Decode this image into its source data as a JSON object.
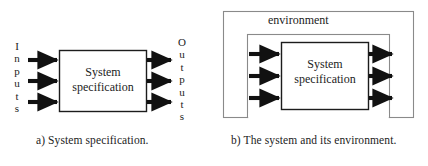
{
  "figure": {
    "type": "block-diagram",
    "panels": [
      {
        "id": "a",
        "caption": "a) System specification.",
        "input_label": "Inputs",
        "input_label_letters": [
          "I",
          "n",
          "p",
          "u",
          "t",
          "s"
        ],
        "output_label": "Outputs",
        "output_label_letters": [
          "O",
          "u",
          "t",
          "p",
          "u",
          "t",
          "s"
        ],
        "box_title_line1": "System",
        "box_title_line2": "specification",
        "input_arrow_count": 3,
        "output_arrow_count": 3
      },
      {
        "id": "b",
        "caption": "b) The system and its environment.",
        "environment_label": "environment",
        "box_title_line1": "System",
        "box_title_line2": "specification",
        "input_arrow_count": 3,
        "output_arrow_count": 3
      }
    ]
  },
  "colors": {
    "background": "#ffffff",
    "stroke": "#1c1c1c",
    "arrow_fill": "#111111",
    "box_fill": "#ffffff",
    "env_stroke": "#6e6e6e",
    "text": "#1c1c1c"
  }
}
